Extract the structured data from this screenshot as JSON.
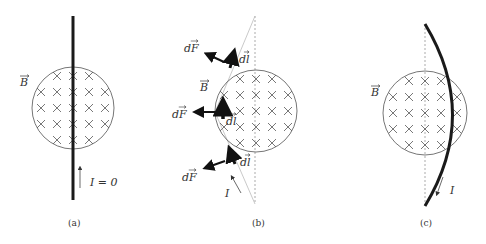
{
  "figure": {
    "panels": [
      {
        "id": "a",
        "caption": "(a)",
        "field_label": "B",
        "current_label": "I = 0",
        "wire_shape": "straight",
        "force_labels": [],
        "element_labels": []
      },
      {
        "id": "b",
        "caption": "(b)",
        "field_label": "B",
        "current_label": "I",
        "wire_shape": "bent-around-circle",
        "force_labels": [
          "dF",
          "dF",
          "dF"
        ],
        "element_labels": [
          "dl",
          "dl",
          "dl"
        ]
      },
      {
        "id": "c",
        "caption": "(c)",
        "field_label": "B",
        "current_label": "I",
        "wire_shape": "curved",
        "force_labels": [],
        "element_labels": []
      }
    ],
    "field_symbol": "×",
    "field_direction": "into page",
    "colors": {
      "wire": "#1a1a1a",
      "circle": "#666666",
      "cross": "#555555",
      "guide": "#888888",
      "text": "#333333"
    }
  }
}
